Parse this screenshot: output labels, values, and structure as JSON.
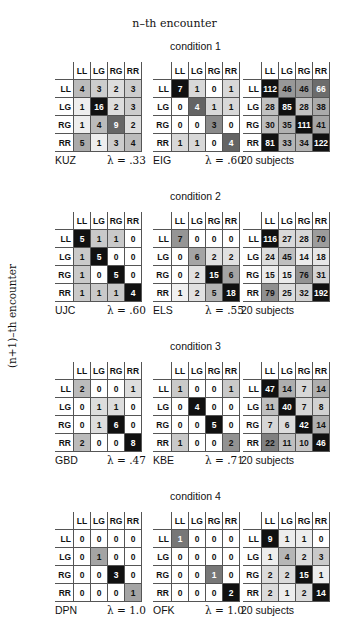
{
  "chart_data": {
    "type": "heatmap",
    "title": "n–th encounter",
    "xlabel": "n–th encounter",
    "ylabel": "(n+1)–th encounter",
    "categories": [
      "LL",
      "LG",
      "RG",
      "RR"
    ],
    "conditions": [
      {
        "label": "condition 1",
        "matrices": [
          {
            "name": "KUZ",
            "lambda": "λ = .33",
            "values": [
              [
                4,
                3,
                2,
                3
              ],
              [
                1,
                16,
                2,
                3
              ],
              [
                1,
                4,
                9,
                2
              ],
              [
                5,
                1,
                3,
                4
              ]
            ]
          },
          {
            "name": "EIG",
            "lambda": "λ = .60",
            "values": [
              [
                7,
                1,
                0,
                1
              ],
              [
                0,
                4,
                1,
                1
              ],
              [
                0,
                0,
                3,
                0
              ],
              [
                1,
                1,
                0,
                4
              ]
            ]
          },
          {
            "name": "20 subjects",
            "lambda": "",
            "values": [
              [
                112,
                46,
                46,
                66
              ],
              [
                28,
                85,
                28,
                38
              ],
              [
                30,
                35,
                111,
                41
              ],
              [
                81,
                33,
                34,
                122
              ]
            ]
          }
        ]
      },
      {
        "label": "condition 2",
        "matrices": [
          {
            "name": "UJC",
            "lambda": "λ = .60",
            "values": [
              [
                5,
                1,
                1,
                0
              ],
              [
                1,
                5,
                0,
                0
              ],
              [
                1,
                0,
                5,
                0
              ],
              [
                1,
                1,
                1,
                4
              ]
            ]
          },
          {
            "name": "ELS",
            "lambda": "λ = .55",
            "values": [
              [
                7,
                0,
                0,
                0
              ],
              [
                0,
                6,
                2,
                2
              ],
              [
                0,
                2,
                15,
                6
              ],
              [
                1,
                2,
                5,
                18
              ]
            ]
          },
          {
            "name": "20 subjects",
            "lambda": "",
            "values": [
              [
                116,
                27,
                28,
                70
              ],
              [
                24,
                45,
                14,
                18
              ],
              [
                15,
                15,
                76,
                31
              ],
              [
                79,
                25,
                32,
                192
              ]
            ]
          }
        ]
      },
      {
        "label": "condition 3",
        "matrices": [
          {
            "name": "GBD",
            "lambda": "λ = .47",
            "values": [
              [
                2,
                0,
                0,
                1
              ],
              [
                0,
                1,
                1,
                0
              ],
              [
                0,
                1,
                6,
                0
              ],
              [
                2,
                0,
                0,
                8
              ]
            ]
          },
          {
            "name": "KBE",
            "lambda": "λ = .71",
            "values": [
              [
                1,
                0,
                0,
                1
              ],
              [
                0,
                4,
                0,
                0
              ],
              [
                0,
                0,
                5,
                0
              ],
              [
                1,
                0,
                0,
                2
              ]
            ]
          },
          {
            "name": "20 subjects",
            "lambda": "",
            "values": [
              [
                47,
                14,
                7,
                14
              ],
              [
                11,
                40,
                7,
                8
              ],
              [
                7,
                6,
                42,
                14
              ],
              [
                22,
                11,
                10,
                46
              ]
            ]
          }
        ]
      },
      {
        "label": "condition 4",
        "matrices": [
          {
            "name": "DPN",
            "lambda": "λ = 1.0",
            "values": [
              [
                0,
                0,
                0,
                0
              ],
              [
                0,
                1,
                0,
                0
              ],
              [
                0,
                0,
                3,
                0
              ],
              [
                0,
                0,
                0,
                1
              ]
            ]
          },
          {
            "name": "OFK",
            "lambda": "λ = 1.0",
            "values": [
              [
                1,
                0,
                0,
                0
              ],
              [
                0,
                0,
                0,
                0
              ],
              [
                0,
                0,
                1,
                0
              ],
              [
                0,
                0,
                0,
                2
              ]
            ]
          },
          {
            "name": "20 subjects",
            "lambda": "",
            "values": [
              [
                9,
                1,
                1,
                0
              ],
              [
                1,
                4,
                2,
                3
              ],
              [
                2,
                2,
                15,
                1
              ],
              [
                2,
                1,
                2,
                14
              ]
            ]
          }
        ]
      }
    ]
  },
  "labels": {
    "top": "n–th encounter",
    "side": "(n+1)–th encounter"
  }
}
